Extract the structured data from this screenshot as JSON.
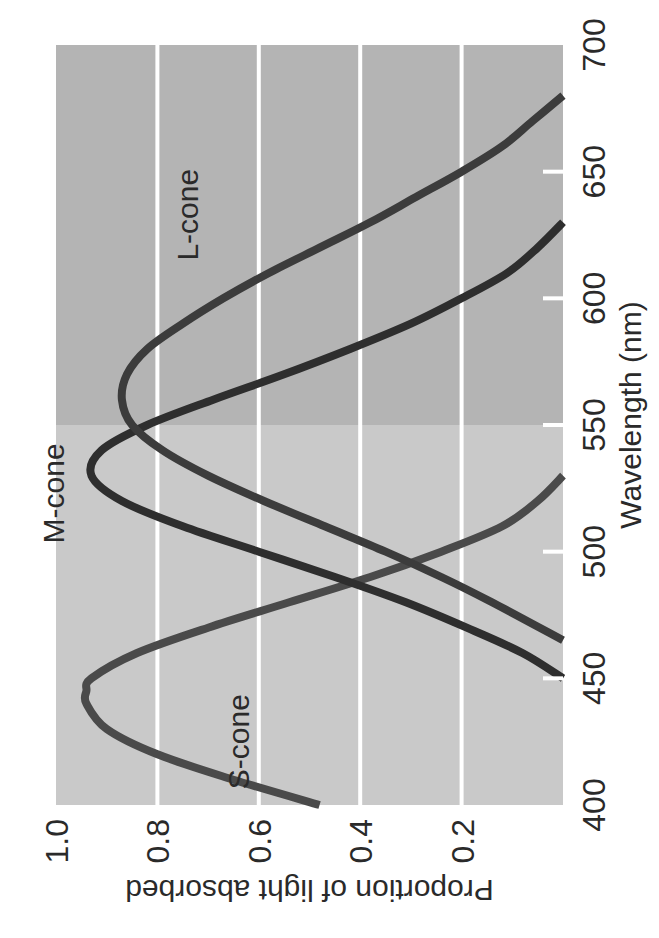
{
  "chart_data": {
    "type": "line",
    "orientation": "rotated-90-ccw",
    "title": "",
    "xlabel": "Wavelength (nm)",
    "ylabel": "Proportion of light absorbed",
    "xlim": [
      400,
      700
    ],
    "ylim": [
      0,
      1.0
    ],
    "x_ticks": [
      400,
      450,
      500,
      550,
      600,
      650,
      700
    ],
    "y_ticks": [
      0.2,
      0.4,
      0.6,
      0.8,
      1.0
    ],
    "y_tick_labels": [
      "0.2",
      "0.4",
      "0.6",
      "0.8",
      "1.0"
    ],
    "grid": {
      "horizontal": true,
      "vertical": false,
      "color": "#ffffff"
    },
    "background": {
      "split_at_x": 550,
      "left_color": "#c9c9c9",
      "right_color": "#b4b4b4"
    },
    "legend": "inline-labels",
    "series": [
      {
        "name": "S-cone",
        "label": "S-cone",
        "color": "#4a4a4a",
        "peak": {
          "x": 445,
          "y": 0.94
        },
        "x": [
          400,
          410,
          420,
          430,
          440,
          445,
          450,
          460,
          470,
          480,
          490,
          500,
          510,
          520,
          530
        ],
        "y": [
          0.48,
          0.65,
          0.8,
          0.9,
          0.94,
          0.94,
          0.93,
          0.84,
          0.7,
          0.54,
          0.38,
          0.24,
          0.12,
          0.05,
          0.0
        ],
        "label_pos": {
          "x": 425,
          "y": 0.62
        }
      },
      {
        "name": "M-cone",
        "label": "M-cone",
        "color": "#2e2e2e",
        "peak": {
          "x": 530,
          "y": 0.93
        },
        "x": [
          450,
          460,
          470,
          480,
          490,
          500,
          510,
          520,
          530,
          540,
          550,
          560,
          570,
          580,
          590,
          600,
          610,
          620,
          630
        ],
        "y": [
          0.0,
          0.08,
          0.19,
          0.31,
          0.45,
          0.6,
          0.75,
          0.87,
          0.93,
          0.91,
          0.82,
          0.69,
          0.55,
          0.42,
          0.3,
          0.2,
          0.11,
          0.05,
          0.0
        ],
        "label_pos": {
          "x": 523,
          "y": 0.985
        }
      },
      {
        "name": "L-cone",
        "label": "L-cone",
        "color": "#3c3c3c",
        "peak": {
          "x": 560,
          "y": 0.87
        },
        "x": [
          465,
          480,
          490,
          500,
          510,
          520,
          530,
          540,
          550,
          560,
          570,
          580,
          590,
          600,
          610,
          620,
          630,
          640,
          650,
          660,
          670,
          680
        ],
        "y": [
          0.0,
          0.14,
          0.24,
          0.35,
          0.47,
          0.59,
          0.7,
          0.79,
          0.85,
          0.87,
          0.86,
          0.82,
          0.75,
          0.67,
          0.58,
          0.48,
          0.38,
          0.29,
          0.2,
          0.12,
          0.06,
          0.0
        ],
        "label_pos": {
          "x": 633,
          "y": 0.72
        }
      }
    ]
  }
}
